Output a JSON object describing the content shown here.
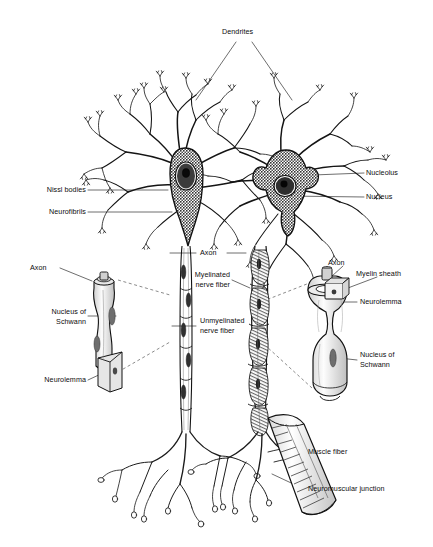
{
  "figure": {
    "background_color": "#ffffff",
    "ink_color": "#111111"
  },
  "labels": {
    "dendrites": "Dendrites",
    "nissl_bodies": "Nissl bodies",
    "neurofibrils": "Neurofibrils",
    "nucleolus": "Nucleolus",
    "nucleus": "Nucleus",
    "axon_center": "Axon",
    "myelinated_nerve_fiber_line1": "Myelinated",
    "myelinated_nerve_fiber_line2": "nerve fiber",
    "unmyelinated_nerve_fiber_line1": "Unmyelinated",
    "unmyelinated_nerve_fiber_line2": "nerve fiber",
    "axon_left_inset": "Axon",
    "nucleus_of_schwann_left_line1": "Nucleus of",
    "nucleus_of_schwann_left_line2": "Schwann",
    "neurolemma_left": "Neurolemma",
    "axon_right_inset": "Axon",
    "myelin_sheath": "Myelin sheath",
    "neurolemma_right": "Neurolemma",
    "nucleus_of_schwann_right_line1": "Nucleus of",
    "nucleus_of_schwann_right_line2": "Schwann",
    "muscle_fiber": "Muscle fiber",
    "neuromuscular_junction": "Neuromuscular junction"
  },
  "parts": {
    "left_neuron": "bipolar-style neuron with stippled soma, oval nucleus and dark nucleolus",
    "right_neuron": "multipolar neuron with stippled star-shaped soma and dark nucleus",
    "left_axon": "unmyelinated nerve fiber running vertically",
    "right_axon": "myelinated nerve fiber with nodes of Ranvier",
    "left_inset": "magnified unmyelinated fiber segment showing Schwann cell and neurolemma",
    "right_inset": "magnified myelinated fiber segment cutaway showing myelin sheath, neurolemma and Schwann nucleus",
    "muscle": "striated muscle fiber contacted by axon terminals"
  }
}
